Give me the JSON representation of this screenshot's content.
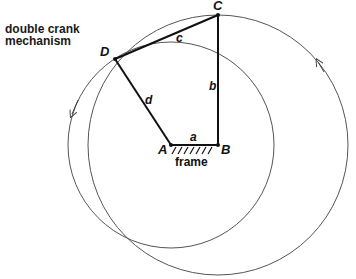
{
  "title": {
    "line1": "double crank",
    "line2": "mechanism"
  },
  "points": {
    "A": "A",
    "B": "B",
    "C": "C",
    "D": "D"
  },
  "links": {
    "a": "a",
    "b": "b",
    "c": "c",
    "d": "d"
  },
  "frame_label": "frame",
  "colors": {
    "link": "#111111",
    "circle": "#555555",
    "background": "#ffffff"
  }
}
